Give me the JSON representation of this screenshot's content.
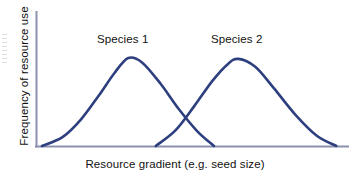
{
  "figure": {
    "background_color": "#ffffff",
    "width": 355,
    "height": 177
  },
  "chart_data": {
    "type": "line",
    "title": "",
    "subtitle": "",
    "xlabel": "Resource gradient (e.g. seed size)",
    "ylabel": "Frequency of resource use",
    "grid": false,
    "legend_position": "inline-annotations",
    "axis_color": "#8a90ad",
    "curve_color": "#2e3f7f",
    "xlim": [
      0,
      100
    ],
    "ylim": [
      0,
      100
    ],
    "x_ticks": [],
    "y_ticks": [],
    "annotations": [
      {
        "text": "Species 1",
        "x": 28,
        "y": 88
      },
      {
        "text": "Species 2",
        "x": 64,
        "y": 88
      }
    ],
    "series": [
      {
        "name": "Species 1",
        "distribution": "normal",
        "mean": 29.5,
        "std_dev": 11.5,
        "peak_height": 100,
        "x_start": 1.3,
        "x_end": 57.5,
        "values": [
          {
            "x": 1.3,
            "y": 0
          },
          {
            "x": 8,
            "y": 10
          },
          {
            "x": 14,
            "y": 30
          },
          {
            "x": 20,
            "y": 58
          },
          {
            "x": 25,
            "y": 83
          },
          {
            "x": 29.5,
            "y": 100
          },
          {
            "x": 34,
            "y": 95
          },
          {
            "x": 40,
            "y": 71
          },
          {
            "x": 46,
            "y": 42
          },
          {
            "x": 52,
            "y": 17
          },
          {
            "x": 57.5,
            "y": 0
          }
        ]
      },
      {
        "name": "Species 2",
        "distribution": "normal",
        "mean": 65.5,
        "std_dev": 11.5,
        "peak_height": 99,
        "x_start": 38.5,
        "x_end": 97.5,
        "values": [
          {
            "x": 38.5,
            "y": 0
          },
          {
            "x": 45,
            "y": 18
          },
          {
            "x": 51,
            "y": 45
          },
          {
            "x": 57,
            "y": 74
          },
          {
            "x": 62,
            "y": 93
          },
          {
            "x": 65.5,
            "y": 99
          },
          {
            "x": 71,
            "y": 90
          },
          {
            "x": 77,
            "y": 66
          },
          {
            "x": 84,
            "y": 36
          },
          {
            "x": 91,
            "y": 12
          },
          {
            "x": 97.5,
            "y": 0
          }
        ]
      }
    ],
    "intersection": {
      "x": 48.5,
      "y": 18
    }
  },
  "labels": {
    "species_1": "Species 1",
    "species_2": "Species 2",
    "x_axis": "Resource gradient (e.g. seed size)",
    "y_axis": "Frequency of resource use"
  }
}
